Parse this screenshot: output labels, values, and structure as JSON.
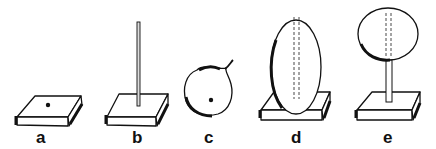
{
  "figure": {
    "panels": [
      {
        "id": "a",
        "label": "a",
        "description": "flat square base with a hole"
      },
      {
        "id": "b",
        "label": "b",
        "description": "base with vertical rod"
      },
      {
        "id": "c",
        "label": "c",
        "description": "round fruit with a hole"
      },
      {
        "id": "d",
        "label": "d",
        "description": "oval object pierced by rod on base"
      },
      {
        "id": "e",
        "label": "e",
        "description": "round object on rod above base"
      }
    ],
    "ink_color": "#111111",
    "background": "#ffffff"
  }
}
